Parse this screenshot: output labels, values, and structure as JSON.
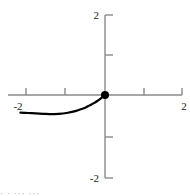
{
  "chart_data": {
    "type": "line",
    "title": "",
    "subtitle": "",
    "xlabel": "",
    "ylabel": "",
    "xlim": [
      -2.2,
      2.2
    ],
    "ylim": [
      -2.2,
      2.2
    ],
    "grid": false,
    "legend": null,
    "axes_style": "centered-cross",
    "x_ticks": [
      -2,
      -1,
      1,
      2
    ],
    "y_ticks": [
      2,
      1,
      -1,
      -2
    ],
    "x_tick_labels": [
      "-2",
      "",
      "",
      "2"
    ],
    "y_tick_labels": [
      "2",
      "",
      "",
      "-2"
    ],
    "visible_tick_labels": {
      "x_left": "-2",
      "x_right": "2",
      "y_top": "2",
      "y_bottom": "-2"
    },
    "series": [
      {
        "name": "curve",
        "color": "#000000",
        "line_width": 2.2,
        "domain": [
          -2.2,
          0
        ],
        "x": [
          -2.2,
          -2.0,
          -1.8,
          -1.6,
          -1.4,
          -1.2,
          -1.0,
          -0.9,
          -0.8,
          -0.7,
          -0.6,
          -0.5,
          -0.4,
          -0.3,
          -0.2,
          -0.1,
          0.0
        ],
        "y": [
          -0.44,
          -0.45,
          -0.46,
          -0.47,
          -0.48,
          -0.47,
          -0.45,
          -0.43,
          -0.41,
          -0.38,
          -0.35,
          -0.31,
          -0.26,
          -0.21,
          -0.15,
          -0.08,
          0.0
        ]
      }
    ],
    "markers": [
      {
        "name": "endpoint-dot",
        "x": 0,
        "y": 0,
        "style": "filled-circle",
        "color": "#000000",
        "radius": 4
      }
    ],
    "colors": {
      "axis": "#8a8a8a",
      "tick": "#8a8a8a",
      "curve": "#000000",
      "marker": "#000000",
      "background": "#ffffff",
      "label": "#1a1a1a"
    }
  },
  "caption": {
    "cut_off_fragment": "· ·   ···    ···"
  }
}
